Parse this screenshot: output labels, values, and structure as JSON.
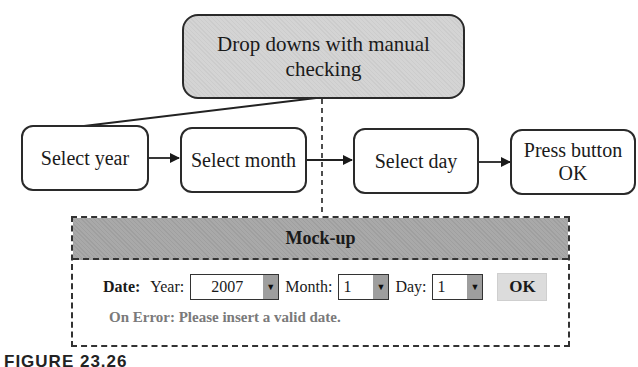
{
  "diagram": {
    "top_node": {
      "line1": "Drop downs with manual",
      "line2": "checking"
    },
    "flow_nodes": [
      {
        "label": "Select year"
      },
      {
        "label": "Select month"
      },
      {
        "label": "Select day"
      },
      {
        "line1": "Press button",
        "line2": "OK"
      }
    ],
    "mockup": {
      "title": "Mock-up",
      "date_label": "Date:",
      "year_label": "Year:",
      "year_value": "2007",
      "month_label": "Month:",
      "month_value": "1",
      "day_label": "Day:",
      "day_value": "1",
      "ok_label": "OK",
      "error_text": "On Error: Please insert a valid date."
    },
    "caption": {
      "figure": "FIGURE 23.26",
      "text": "Date entry with drop-downs ..."
    },
    "icons": {
      "dropdown_arrow": "▼"
    },
    "colors": {
      "top_node_fill": "#d4d4d4",
      "mockup_header_fill": "#a9a9a9",
      "error_text": "#7a7a7a",
      "ok_button_fill": "#dcdcdc"
    }
  }
}
